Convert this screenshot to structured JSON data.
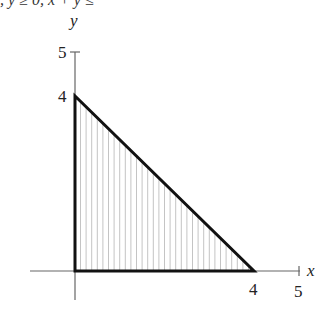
{
  "header": {
    "clipped_text": ", y ≥ 0, x + y ≤"
  },
  "chart_data": {
    "type": "region",
    "title": "",
    "xlabel": "x",
    "ylabel": "y",
    "xlim": [
      0,
      5
    ],
    "ylim": [
      0,
      5
    ],
    "x_ticks": [
      "4",
      "5"
    ],
    "y_ticks": [
      "4",
      "5"
    ],
    "region": {
      "shape": "triangle",
      "vertices": [
        [
          0,
          0
        ],
        [
          4,
          0
        ],
        [
          0,
          4
        ]
      ],
      "fill": "vertical-hatching",
      "boundary": "x + y = 4"
    },
    "grid": false,
    "colors": {
      "boundary": "#111111",
      "hatch": "#bdbdbd",
      "axis": "#555555"
    }
  },
  "labels": {
    "x_axis": "x",
    "y_axis": "y",
    "x_tick_4": "4",
    "x_tick_5": "5",
    "y_tick_4": "4",
    "y_tick_5": "5"
  }
}
